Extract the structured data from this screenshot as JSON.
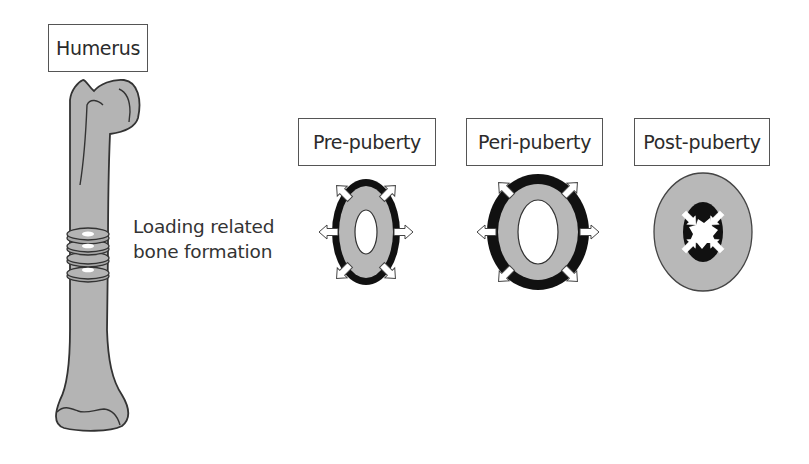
{
  "bone": {
    "label": "Humerus",
    "caption_line1": "Loading related",
    "caption_line2": "bone formation"
  },
  "stages": [
    {
      "label": "Pre-puberty",
      "growth": "periosteal expansion",
      "arrows": "outward"
    },
    {
      "label": "Peri-puberty",
      "growth": "periosteal expansion",
      "arrows": "outward"
    },
    {
      "label": "Post-puberty",
      "growth": "endosteal apposition",
      "arrows": "inward"
    }
  ],
  "colors": {
    "bone_fill": "#b4b4b4",
    "outline": "#333333",
    "new_bone": "#111111",
    "marrow": "#ffffff"
  }
}
